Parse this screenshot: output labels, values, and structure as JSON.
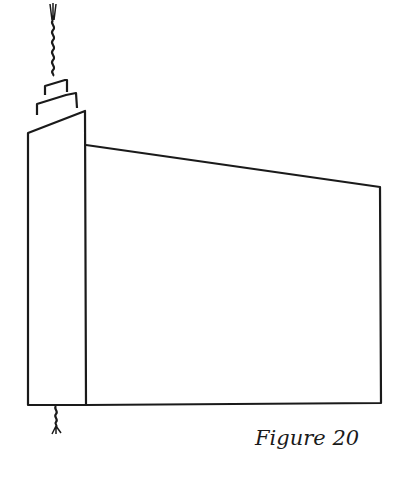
{
  "figure": {
    "caption": "Figure 20",
    "stroke_color": "#1a1a1a",
    "background": "#ffffff"
  }
}
